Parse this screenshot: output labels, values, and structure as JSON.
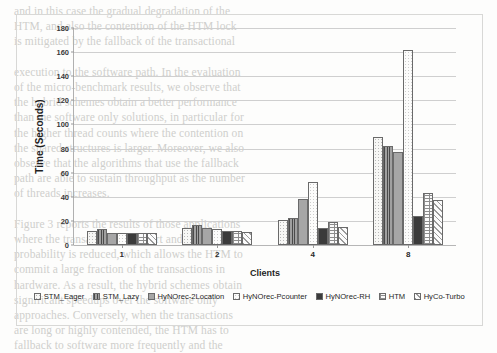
{
  "bleed_text": "and in this case the gradual degradation of the\nHTM, and also the contention of the HTM lock\nis mitigated by the fallback of the transactional\n\nexecution to the software path. In the evaluation\nof the micro-benchmark results, we observe that\nthe hybrid schemes obtain a better performance\nthan the software only solutions, in particular for\nthe higher thread counts where the contention on\nthe shared structures is larger. Moreover, we also\nobserve that the algorithms that use the fallback\npath are able to sustain throughput as the number\nof threads increases.\n\nFigure 3 reports the results of those applications\nwhere the transactions are short and the conflict\nprobability is reduced, which allows the HTM to\ncommit a large fraction of the transactions in\nhardware. As a result, the hybrid schemes obtain\nsignificant speedups over the software only\napproaches. Conversely, when the transactions\nare long or highly contended, the HTM has to\nfallback to software more frequently and the\nbenefits become less pronounced overall.",
  "chart_data": {
    "type": "bar",
    "title": "",
    "xlabel": "Clients",
    "ylabel": "Time (Seconds)",
    "categories": [
      "1",
      "2",
      "4",
      "8"
    ],
    "ylim": [
      0,
      180
    ],
    "ytick_step": 20,
    "yticks": [
      0,
      20,
      40,
      60,
      80,
      100,
      120,
      140,
      160,
      180
    ],
    "grid": true,
    "legend_position": "bottom",
    "series": [
      {
        "name": "STM_Eager",
        "pattern": "p-dots-light",
        "values": [
          12,
          14,
          21,
          90
        ]
      },
      {
        "name": "STM_Lazy",
        "pattern": "p-vstripe-dark",
        "values": [
          13,
          17,
          22.5,
          82.5
        ]
      },
      {
        "name": "HyNOrec-2Location",
        "pattern": "p-solid-gray",
        "values": [
          10,
          14,
          38.5,
          77
        ]
      },
      {
        "name": "HyNOrec-Pcounter",
        "pattern": "p-dots-faint",
        "values": [
          10,
          13,
          52,
          162
        ]
      },
      {
        "name": "HyNOrec-RH",
        "pattern": "p-solid-dark",
        "values": [
          10,
          12,
          14.5,
          24
        ]
      },
      {
        "name": "HTM",
        "pattern": "p-brick",
        "values": [
          10,
          12,
          19.5,
          43.5
        ]
      },
      {
        "name": "HyCo-Turbo",
        "pattern": "p-diag",
        "values": [
          10,
          11,
          15,
          37.5
        ]
      }
    ]
  }
}
